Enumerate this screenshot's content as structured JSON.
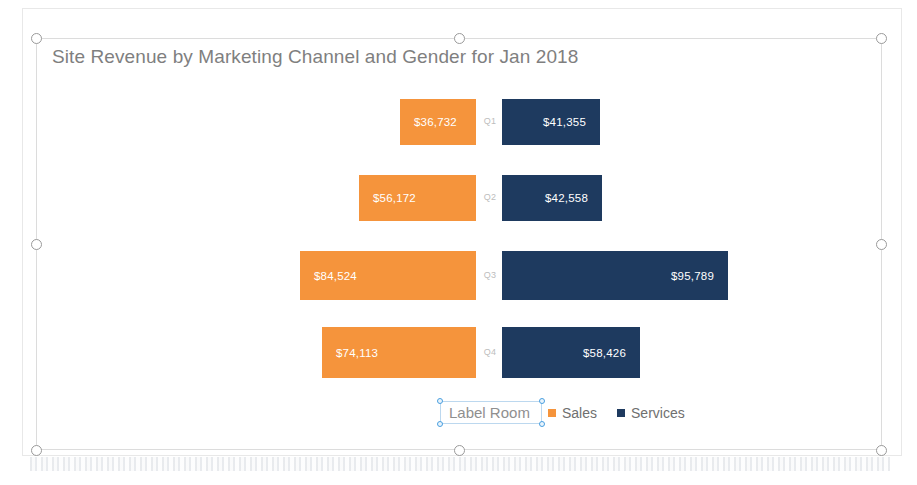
{
  "chart_data": {
    "type": "bar",
    "subtype": "tornado-diverging-horizontal",
    "title": "Site Revenue by Marketing Channel and Gender for Jan 2018",
    "xlabel": "",
    "ylabel": "",
    "grid": false,
    "legend_position": "bottom",
    "categories": [
      "Q1",
      "Q2",
      "Q3",
      "Q4"
    ],
    "series": [
      {
        "name": "Sales",
        "color": "#F5943C",
        "side": "left",
        "values": [
          36732,
          56172,
          84524,
          74113
        ],
        "value_labels": [
          "$36,732",
          "$56,172",
          "$84,524",
          "$74,113"
        ]
      },
      {
        "name": "Services",
        "color": "#1E3A5F",
        "side": "right",
        "values": [
          41355,
          42558,
          95789,
          58426
        ],
        "value_labels": [
          "$41,355",
          "$42,558",
          "$95,789",
          "$58,426"
        ]
      }
    ],
    "axis_max": 100000
  },
  "chart": {
    "title": "Site Revenue by Marketing Channel and Gender for Jan 2018",
    "title_color": "#7f7f7f",
    "plot_background": "#ffffff"
  },
  "legend": {
    "entries": [
      {
        "label": "Sales",
        "color": "#F5943C"
      },
      {
        "label": "Services",
        "color": "#1E3A5F"
      }
    ]
  },
  "text_box": {
    "value": "Label Room",
    "selected": true,
    "border_color": "#bcd8ef",
    "handle_color": "#4a9fe0"
  },
  "selection": {
    "object_border_color": "#dcdcdc",
    "handle_border_color": "#9a9a9a",
    "handle_fill": "#ffffff"
  }
}
